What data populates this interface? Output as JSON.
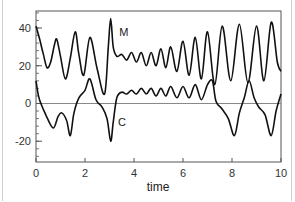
{
  "chart_data": {
    "type": "line",
    "title": "",
    "xlabel": "time",
    "ylabel": "",
    "xlim": [
      0,
      10
    ],
    "ylim": [
      -31,
      49
    ],
    "x_ticks": [
      0,
      2,
      4,
      6,
      8,
      10
    ],
    "y_ticks": [
      -20,
      0,
      20,
      40
    ],
    "x_tick_labels": [
      "0",
      "2",
      "4",
      "6",
      "8",
      "10"
    ],
    "y_tick_labels": [
      "-20",
      "0",
      "20",
      "40"
    ],
    "grid": false,
    "reference_line": {
      "y": 0
    },
    "series": [
      {
        "name": "M",
        "label_position": {
          "x": 3.4,
          "y": 36
        },
        "x": [
          0,
          0.15,
          0.3,
          0.45,
          0.6,
          0.75,
          0.85,
          1.0,
          1.2,
          1.4,
          1.6,
          1.75,
          1.95,
          2.2,
          2.5,
          2.8,
          2.95,
          3.05,
          3.15,
          3.3,
          3.5,
          3.7,
          3.9,
          4.1,
          4.3,
          4.5,
          4.7,
          4.9,
          5.1,
          5.3,
          5.5,
          5.75,
          6.0,
          6.25,
          6.5,
          6.75,
          7.0,
          7.3,
          7.6,
          7.95,
          8.3,
          8.65,
          9.0,
          9.3,
          9.6,
          9.85,
          10.0
        ],
        "values": [
          41,
          34,
          26,
          19,
          22,
          31,
          34,
          25,
          13,
          24,
          38,
          26,
          15,
          35,
          18,
          5,
          30,
          45,
          30,
          25,
          26,
          23,
          27,
          22,
          27,
          20,
          27,
          20,
          29,
          19,
          30,
          17,
          33,
          15,
          35,
          13,
          38,
          10,
          41,
          12,
          42,
          11,
          41,
          12,
          43,
          22,
          17
        ]
      },
      {
        "name": "C",
        "label_position": {
          "x": 3.35,
          "y": -12
        },
        "x": [
          0,
          0.1,
          0.2,
          0.4,
          0.7,
          0.9,
          1.05,
          1.25,
          1.4,
          1.55,
          1.75,
          2.0,
          2.2,
          2.45,
          2.7,
          2.9,
          3.05,
          3.15,
          3.3,
          3.5,
          3.7,
          3.9,
          4.1,
          4.3,
          4.5,
          4.7,
          4.9,
          5.1,
          5.3,
          5.5,
          5.75,
          6.0,
          6.25,
          6.5,
          6.75,
          7.0,
          7.2,
          7.35,
          7.6,
          7.85,
          8.1,
          8.3,
          8.5,
          8.7,
          8.9,
          9.1,
          9.35,
          9.6,
          9.8,
          10.0
        ],
        "values": [
          12,
          4,
          0,
          -6,
          -13,
          -7,
          -5,
          -9,
          -17,
          -5,
          3,
          7,
          13,
          2,
          -2,
          -8,
          -20,
          -10,
          3,
          6,
          5,
          7,
          5,
          8,
          5,
          8,
          4,
          8,
          4,
          9,
          3,
          9,
          3,
          10,
          2,
          10,
          12,
          1,
          -3,
          -8,
          -17,
          -5,
          3,
          12,
          3,
          -2,
          -6,
          -17,
          -4,
          5
        ]
      }
    ]
  }
}
